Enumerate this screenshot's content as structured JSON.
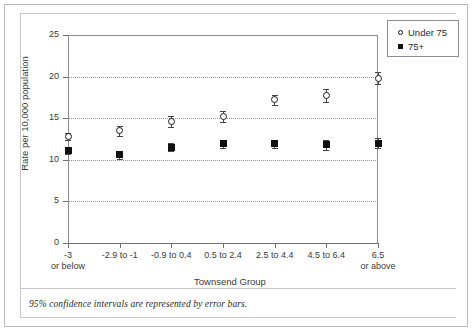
{
  "chart_data": {
    "type": "scatter",
    "title": "",
    "xlabel": "Townsend Group",
    "ylabel": "Rate per 10,000 population",
    "ylim": [
      0,
      25
    ],
    "yticks": [
      0,
      5,
      10,
      15,
      20,
      25
    ],
    "grid": true,
    "legend_position": "top-right",
    "categories": [
      "-3\nor below",
      "-2.9 to -1",
      "-0.9 to 0.4",
      "0.5 to 2.4",
      "2.5 to 4.4",
      "4.5 to 6.4",
      "6.5\nor above"
    ],
    "category_lines": [
      [
        "-3",
        "or below"
      ],
      [
        "-2.9 to -1",
        ""
      ],
      [
        "-0.9 to 0.4",
        ""
      ],
      [
        "0.5 to 2.4",
        ""
      ],
      [
        "2.5 to 4.4",
        ""
      ],
      [
        "4.5 to 6.4",
        ""
      ],
      [
        "6.5",
        "or above"
      ]
    ],
    "series": [
      {
        "name": "Under 75",
        "marker": "open-circle",
        "values": [
          12.8,
          13.5,
          14.6,
          15.2,
          17.2,
          17.7,
          19.8
        ],
        "ci_low": [
          12.4,
          12.9,
          13.9,
          14.5,
          16.6,
          16.9,
          19.1
        ],
        "ci_high": [
          13.2,
          14.1,
          15.3,
          15.9,
          17.8,
          18.5,
          20.5
        ]
      },
      {
        "name": "75+",
        "marker": "filled-square",
        "values": [
          11.1,
          10.6,
          11.5,
          11.9,
          11.9,
          11.8,
          12.0
        ],
        "ci_low": [
          10.7,
          10.1,
          11.0,
          11.4,
          11.4,
          11.2,
          11.4
        ],
        "ci_high": [
          11.5,
          11.1,
          12.0,
          12.4,
          12.4,
          12.4,
          12.6
        ]
      }
    ],
    "annotations": [
      "95% confidence intervals are represented by error bars."
    ]
  },
  "legend": {
    "items": [
      {
        "label": "Under 75",
        "marker": "open-circle"
      },
      {
        "label": "75+",
        "marker": "filled-square"
      }
    ]
  },
  "caption": {
    "text": "95% confidence intervals are represented by error bars."
  }
}
